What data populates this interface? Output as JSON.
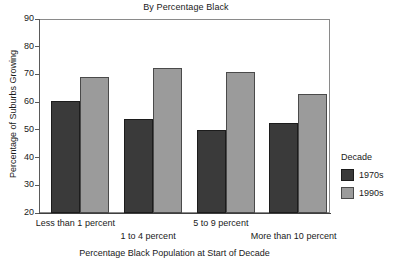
{
  "chart_data": {
    "type": "bar",
    "title": "By Percentage Black",
    "xlabel": "Percentage Black Population at Start of Decade",
    "ylabel": "Percentage of Suburbs Growing",
    "categories": [
      "Less than 1 percent",
      "1 to 4 percent",
      "5 to 9 percent",
      "More than 10 percent"
    ],
    "series": [
      {
        "name": "1970s",
        "color": "#3a3a3a",
        "values": [
          60.5,
          54,
          50,
          52.5
        ]
      },
      {
        "name": "1990s",
        "color": "#9b9b9b",
        "values": [
          69,
          72.5,
          71,
          63
        ]
      }
    ],
    "ylim": [
      20,
      90
    ],
    "yticks": [
      20,
      30,
      40,
      50,
      60,
      70,
      80,
      90
    ],
    "ytick_labels": [
      "20",
      "30",
      "40",
      "50",
      "60",
      "70",
      "80",
      "90"
    ],
    "grid": false,
    "legend_position": "right",
    "legend_title": "Decade"
  }
}
